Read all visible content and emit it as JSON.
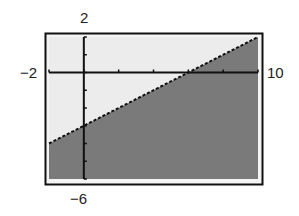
{
  "window_labels": {
    "ymax": "2",
    "ymin": "−6",
    "xmin": "−2",
    "xmax": "10"
  },
  "colors": {
    "screen_bg": "#ececec",
    "shade": "#7a7a7a",
    "axes": "#111111",
    "frame": "#111111"
  },
  "chart_data": {
    "type": "area",
    "title": "",
    "xlabel": "",
    "ylabel": "",
    "xlim": [
      -2,
      10
    ],
    "ylim": [
      -6,
      2
    ],
    "x_ticks_step": 2,
    "y_ticks_step": 1,
    "grid": false,
    "boundary_line": {
      "equation": "y = 0.5x - 3",
      "slope": 0.5,
      "intercept": -3,
      "style": "dashed/pixelated"
    },
    "shaded_region": "below line (y <= 0.5x - 3)",
    "points": {
      "x": [
        -2,
        0,
        6,
        10
      ],
      "y": [
        -4,
        -3,
        0,
        2
      ]
    },
    "legend": []
  }
}
